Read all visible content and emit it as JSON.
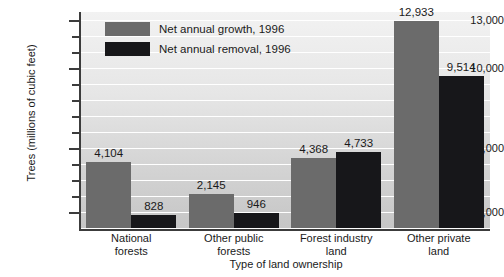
{
  "chart_data": {
    "type": "bar",
    "title": "",
    "xlabel": "Type of land ownership",
    "ylabel": "Trees (millions of cubic feet)",
    "categories": [
      "National forests",
      "Other public forests",
      "Forest industry land",
      "Other private land"
    ],
    "category_lines": [
      [
        "National",
        "forests"
      ],
      [
        "Other public",
        "forests"
      ],
      [
        "Forest industry",
        "land"
      ],
      [
        "Other private",
        "land"
      ]
    ],
    "series": [
      {
        "name": "Net annual growth, 1996",
        "color": "#6b6b6b",
        "values": [
          4104,
          2145,
          4368,
          12933
        ],
        "value_labels": [
          "4,104",
          "2,145",
          "4,368",
          "12,933"
        ]
      },
      {
        "name": "Net annual removal, 1996",
        "color": "#17171a",
        "values": [
          828,
          946,
          4733,
          9514
        ],
        "value_labels": [
          "828",
          "946",
          "4,733",
          "9,514"
        ]
      }
    ],
    "ylim": [
      0,
      13500
    ],
    "ytick_labels": [
      "13,000",
      "10,000",
      "5,000",
      "1,000"
    ],
    "ytick_values": [
      13000,
      10000,
      5000,
      1000
    ],
    "yminor_values": [
      12000,
      11000,
      9000,
      8000,
      7000,
      6000,
      4000,
      3000,
      2000
    ],
    "grid": true,
    "legend_position": "top-left-inside",
    "plot_background": "#e0e0e0",
    "gridline_color": "#ffffff",
    "axis_color": "#3c3c3c"
  }
}
